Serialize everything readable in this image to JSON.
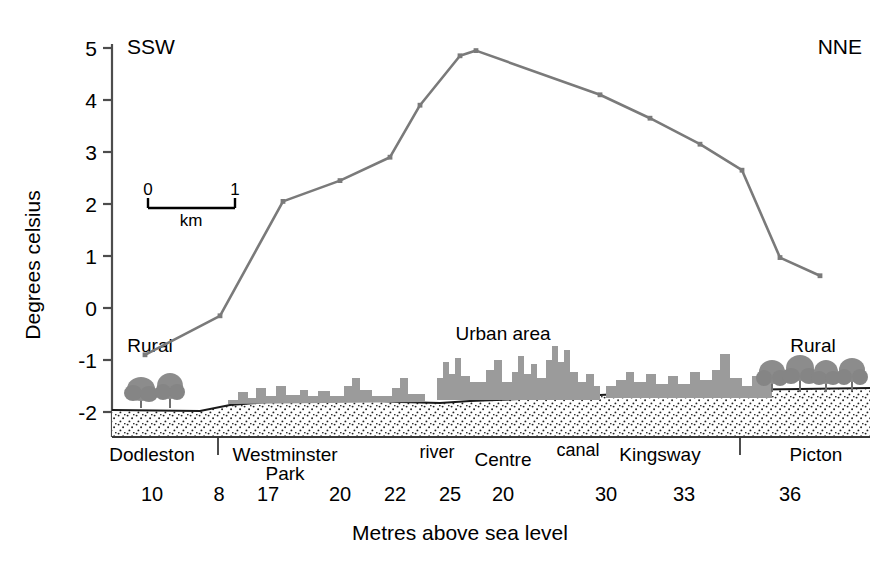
{
  "orientation": {
    "left_label": "SSW",
    "right_label": "NNE"
  },
  "axes": {
    "y_title": "Degrees celsius",
    "y_ticks": [
      "5",
      "4",
      "3",
      "2",
      "1",
      "0",
      "-1",
      "-2"
    ],
    "x_title": "Metres above sea level"
  },
  "scalebar": {
    "left": "0",
    "right": "1",
    "unit": "km"
  },
  "annotations": {
    "rural_left": "Rural",
    "rural_right": "Rural",
    "urban_area": "Urban area"
  },
  "place_labels": [
    {
      "text": "Dodleston",
      "x": 152,
      "y": 461,
      "size": 19
    },
    {
      "text": "Westminster",
      "x": 285,
      "y": 461,
      "size": 19
    },
    {
      "text": "Park",
      "x": 285,
      "y": 480,
      "size": 19
    },
    {
      "text": "river",
      "x": 437,
      "y": 458,
      "size": 18
    },
    {
      "text": "Centre",
      "x": 503,
      "y": 466,
      "size": 19
    },
    {
      "text": "canal",
      "x": 578,
      "y": 456,
      "size": 18
    },
    {
      "text": "Kingsway",
      "x": 660,
      "y": 461,
      "size": 19
    },
    {
      "text": "Picton",
      "x": 816,
      "y": 461,
      "size": 19
    }
  ],
  "elevations": [
    {
      "value": "10",
      "x": 152
    },
    {
      "value": "8",
      "x": 219
    },
    {
      "value": "17",
      "x": 268
    },
    {
      "value": "20",
      "x": 340
    },
    {
      "value": "22",
      "x": 395
    },
    {
      "value": "25",
      "x": 450
    },
    {
      "value": "20",
      "x": 503
    },
    {
      "value": "30",
      "x": 606
    },
    {
      "value": "33",
      "x": 684
    },
    {
      "value": "36",
      "x": 790
    }
  ],
  "colors": {
    "line": "#7a7a7a",
    "buildings": "#9b9b9b",
    "trees": "#8c8c8c",
    "axis": "#4d4d4d",
    "text": "#000000"
  },
  "chart_data": {
    "type": "line",
    "title": "",
    "xlabel": "Metres above sea level",
    "ylabel": "Degrees celsius",
    "ylim": [
      -2.4,
      5.2
    ],
    "y_ticks": [
      5,
      4,
      3,
      2,
      1,
      0,
      -1,
      -2
    ],
    "grid": false,
    "legend": "none",
    "series": [
      {
        "name": "Temperature transect",
        "points": [
          {
            "px": 145,
            "temp": -0.9
          },
          {
            "px": 220,
            "temp": -0.15
          },
          {
            "px": 283,
            "temp": 2.05
          },
          {
            "px": 340,
            "temp": 2.45
          },
          {
            "px": 390,
            "temp": 2.9
          },
          {
            "px": 420,
            "temp": 3.9
          },
          {
            "px": 460,
            "temp": 4.85
          },
          {
            "px": 476,
            "temp": 4.95
          },
          {
            "px": 600,
            "temp": 4.1
          },
          {
            "px": 650,
            "temp": 3.65
          },
          {
            "px": 700,
            "temp": 3.15
          },
          {
            "px": 742,
            "temp": 2.65
          },
          {
            "px": 780,
            "temp": 0.97
          },
          {
            "px": 820,
            "temp": 0.62
          }
        ]
      }
    ],
    "elevation_profile_m": [
      10,
      8,
      17,
      20,
      22,
      25,
      20,
      30,
      33,
      36
    ],
    "transect_places": [
      "Dodleston",
      "Westminster Park",
      "river",
      "Centre",
      "canal",
      "Kingsway",
      "Picton"
    ]
  }
}
